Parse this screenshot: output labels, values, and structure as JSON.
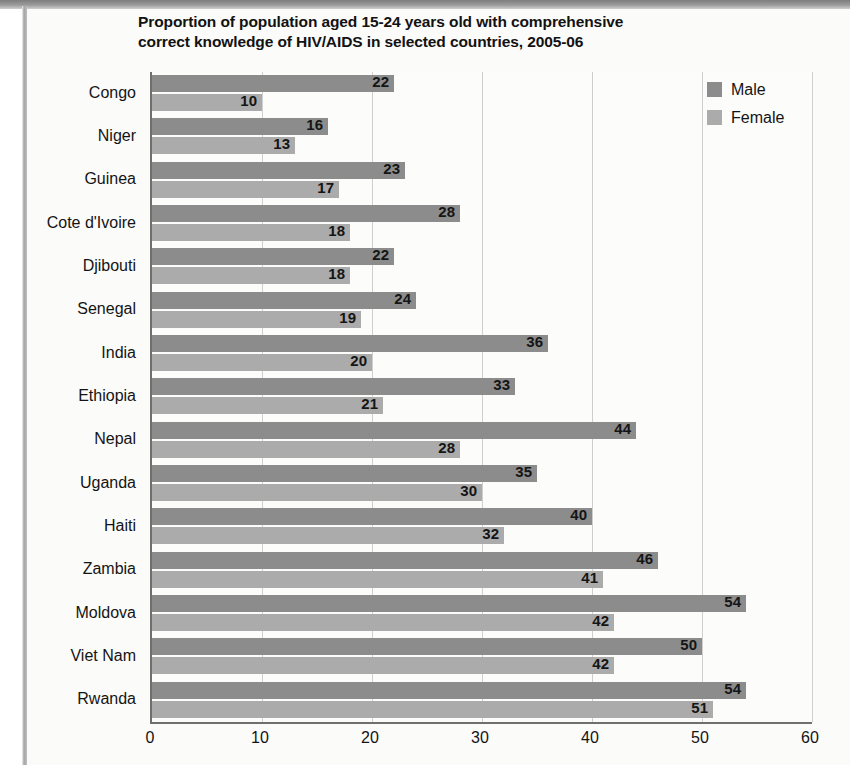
{
  "chart_data": {
    "type": "bar",
    "orientation": "horizontal",
    "title": "Proportion of population aged 15-24 years old with comprehensive correct knowledge of HIV/AIDS in selected countries, 2005-06",
    "title_line1": "Proportion of population aged 15-24 years old with comprehensive",
    "title_line2": "correct knowledge of HIV/AIDS in selected countries, 2005-06",
    "xlabel": "",
    "ylabel": "",
    "xlim": [
      0,
      60
    ],
    "ylim": null,
    "grid": "vertical",
    "xticks": [
      "0",
      "10",
      "20",
      "30",
      "40",
      "50",
      "60"
    ],
    "xtick_values": [
      0,
      10,
      20,
      30,
      40,
      50,
      60
    ],
    "categories": [
      "Congo",
      "Niger",
      "Guinea",
      "Cote d'Ivoire",
      "Djibouti",
      "Senegal",
      "India",
      "Ethiopia",
      "Nepal",
      "Uganda",
      "Haiti",
      "Zambia",
      "Moldova",
      "Viet Nam",
      "Rwanda"
    ],
    "series": [
      {
        "name": "Male",
        "color": "#8c8c8c",
        "values": [
          22,
          16,
          23,
          28,
          22,
          24,
          36,
          33,
          44,
          35,
          40,
          46,
          54,
          50,
          54
        ]
      },
      {
        "name": "Female",
        "color": "#ababab",
        "values": [
          10,
          13,
          17,
          18,
          18,
          19,
          20,
          21,
          28,
          30,
          32,
          41,
          42,
          42,
          51
        ]
      }
    ],
    "legend": {
      "position": "top-right-inside",
      "entries": [
        {
          "label": "Male",
          "color": "#8c8c8c"
        },
        {
          "label": "Female",
          "color": "#ababab"
        }
      ]
    },
    "data_labels": true,
    "colors": {
      "male": "#8c8c8c",
      "female": "#ababab",
      "axis": "#6f6f6f",
      "gridline": "#cfcfcf",
      "plot_background": "#fcfcfb",
      "page_background": "#fbfbfa",
      "text": "#141414"
    }
  }
}
